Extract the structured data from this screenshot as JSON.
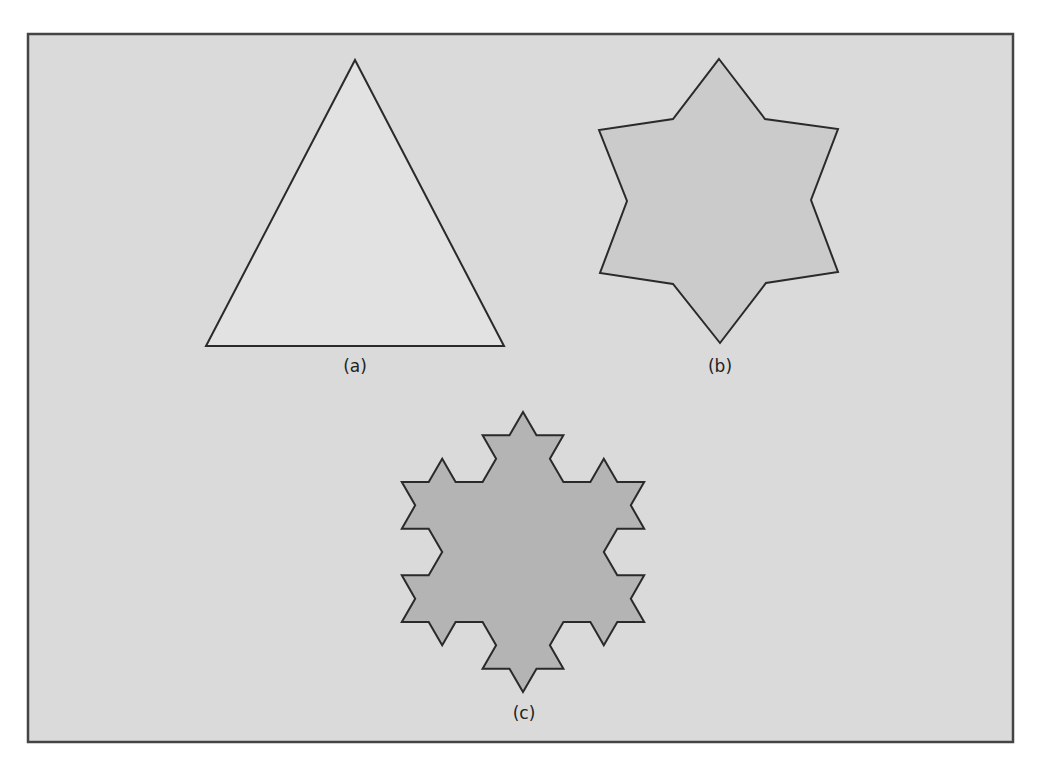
{
  "figure": {
    "frame": {
      "x": 28,
      "y": 34,
      "width": 985,
      "height": 708,
      "fill": "#dadada",
      "stroke": "#444444"
    },
    "panels": [
      {
        "id": "a",
        "label": "(a)",
        "label_pos": [
          355,
          372
        ],
        "shape": "triangle",
        "fill": "#e2e2e2",
        "stroke": "#2a2a2a",
        "points": [
          [
            355,
            60
          ],
          [
            504,
            346
          ],
          [
            206,
            346
          ]
        ]
      },
      {
        "id": "b",
        "label": "(b)",
        "label_pos": [
          720,
          372
        ],
        "shape": "koch-level-1 (hexagram)",
        "fill": "#cbcbcb",
        "stroke": "#2a2a2a",
        "points": [
          [
            719,
            59
          ],
          [
            765,
            119
          ],
          [
            838,
            129
          ],
          [
            811,
            200
          ],
          [
            838,
            272
          ],
          [
            766,
            283
          ],
          [
            720,
            343
          ],
          [
            673,
            284
          ],
          [
            600,
            273
          ],
          [
            627,
            201
          ],
          [
            599,
            130
          ],
          [
            673,
            119
          ]
        ]
      },
      {
        "id": "c",
        "label": "(c)",
        "label_pos": [
          524,
          719
        ],
        "shape": "koch-level-2 snowflake",
        "fill": "#b4b4b4",
        "stroke": "#2a2a2a",
        "koch": {
          "center": [
            523,
            552
          ],
          "circumradius": 140,
          "iterations": 2
        }
      }
    ]
  }
}
